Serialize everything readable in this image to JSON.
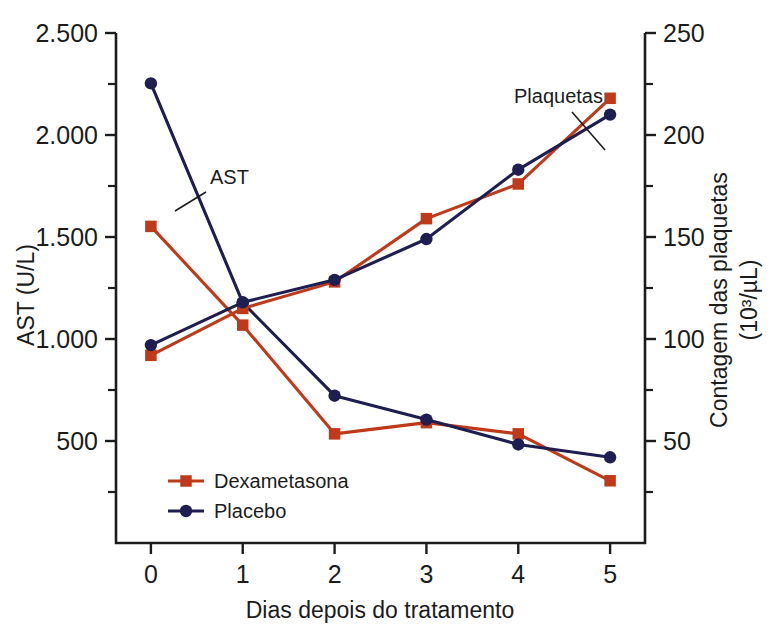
{
  "chart_data": {
    "type": "line",
    "title": "",
    "xlabel": "Dias depois do tratamento",
    "ylabel": "AST (U/L)",
    "ylabel_right_line1": "Contagem das plaquetas",
    "ylabel_right_line2": "(10³/µL)",
    "x": [
      0,
      1,
      2,
      3,
      4,
      5
    ],
    "xtick_labels": [
      "0",
      "1",
      "2",
      "3",
      "4",
      "5"
    ],
    "xlim": [
      -0.38,
      5.38
    ],
    "left_axis": {
      "label": "AST (U/L)",
      "ylim": [
        0,
        2500
      ],
      "ticks": [
        500,
        1000,
        1500,
        2000,
        2500
      ],
      "tick_labels": [
        "500",
        "1.000",
        "1.500",
        "2.000",
        "2.500"
      ],
      "minor_ticks": [
        250,
        750,
        1250,
        1750,
        2250
      ]
    },
    "right_axis": {
      "label": "Contagem das plaquetas (10³/µL)",
      "ylim": [
        0,
        250
      ],
      "ticks": [
        50,
        100,
        150,
        200,
        250
      ],
      "tick_labels": [
        "50",
        "100",
        "150",
        "200",
        "250"
      ],
      "minor_ticks": [
        25,
        75,
        125,
        175,
        225
      ]
    },
    "grid": false,
    "legend_position": "lower-left-inside",
    "annotations": [
      {
        "text": "AST",
        "x_px": 210,
        "y_px": 184
      },
      {
        "text": "Plaquetas",
        "x_px": 514,
        "y_px": 103
      }
    ],
    "series": [
      {
        "name": "Dexametasona",
        "measure": "AST",
        "axis": "left",
        "color": "#bf3a1a",
        "marker": "square",
        "values": [
          1552,
          1068,
          535,
          590,
          535,
          305
        ]
      },
      {
        "name": "Placebo",
        "measure": "AST",
        "axis": "left",
        "color": "#1e1e50",
        "marker": "circle",
        "values": [
          2253,
          1178,
          722,
          605,
          483,
          420
        ]
      },
      {
        "name": "Dexametasona",
        "measure": "Plaquetas",
        "axis": "right",
        "color": "#bf3a1a",
        "marker": "square",
        "values": [
          92,
          115,
          128,
          159,
          176,
          218
        ]
      },
      {
        "name": "Placebo",
        "measure": "Plaquetas",
        "axis": "right",
        "color": "#1e1e50",
        "marker": "circle",
        "values": [
          97,
          118,
          129,
          149,
          183,
          210
        ]
      }
    ],
    "legend": [
      {
        "label": "Dexametasona",
        "color": "#bf3a1a",
        "marker": "square"
      },
      {
        "label": "Placebo",
        "color": "#1e1e50",
        "marker": "circle"
      }
    ]
  }
}
